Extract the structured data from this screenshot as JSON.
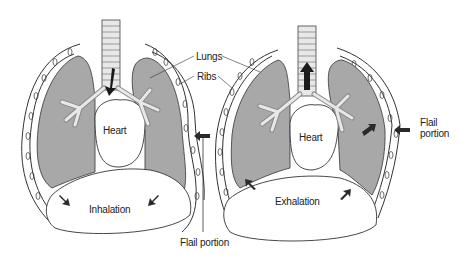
{
  "diagram": {
    "panels": [
      {
        "id": "inhalation",
        "caption": "Inhalation",
        "heart_label": "Heart"
      },
      {
        "id": "exhalation",
        "caption": "Exhalation",
        "heart_label": "Heart"
      }
    ],
    "labels": {
      "lungs": "Lungs",
      "ribs": "Ribs",
      "flail_portion_bottom": "Flail portion",
      "flail_line1": "Flail",
      "flail_line2": "portion"
    },
    "colors": {
      "lung_fill": "#a8a8a8",
      "outline": "#333333",
      "arrow": "#2a2a2a",
      "background": "#ffffff"
    }
  }
}
